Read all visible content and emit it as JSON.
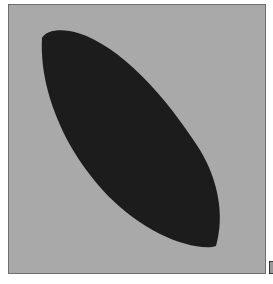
{
  "image": {
    "background_color": "#a9a9a9",
    "frame_color": "#6e6e6e",
    "shape": {
      "type": "leaf-ellipse",
      "fill": "#1c1c1c",
      "orientation": "diagonal-top-left-to-bottom-right"
    }
  }
}
